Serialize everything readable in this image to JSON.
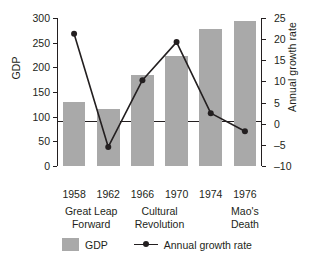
{
  "chart_data": {
    "type": "bar",
    "title": "",
    "xlabel": "",
    "ylabel": "GDP",
    "y2label": "Annual growth rate",
    "categories": [
      "1958",
      "1962",
      "1966",
      "1970",
      "1974",
      "1976"
    ],
    "events": [
      "Great Leap Forward",
      "Cultural Revolution",
      "Mao's Death"
    ],
    "event_lines": [
      [
        "Great Leap",
        "Forward"
      ],
      [
        "Cultural",
        "Revolution"
      ],
      [
        "Mao's",
        "Death"
      ]
    ],
    "series": [
      {
        "name": "GDP",
        "type": "bar",
        "color": "#a9a9a9",
        "values": [
          130,
          115,
          185,
          223,
          277,
          293
        ]
      },
      {
        "name": "Annual growth rate",
        "type": "line",
        "color": "#231f20",
        "axis": "right",
        "values": [
          21.3,
          -5.5,
          10.3,
          19.3,
          2.5,
          -1.8
        ]
      }
    ],
    "ylim": [
      0,
      300
    ],
    "yticks": [
      0,
      50,
      100,
      150,
      200,
      250,
      300
    ],
    "y2lim": [
      -10,
      25
    ],
    "y2ticks": [
      -10,
      -5,
      0,
      5,
      10,
      15,
      20,
      25
    ],
    "grid": false,
    "legend_position": "bottom",
    "legend": [
      {
        "label": "GDP",
        "marker": "swatch"
      },
      {
        "label": "Annual growth rate",
        "marker": "line-dot"
      }
    ]
  },
  "colors": {
    "bar_fill": "#a9a9a9",
    "line": "#231f20",
    "axis": "#231f20",
    "background": "#ffffff"
  }
}
